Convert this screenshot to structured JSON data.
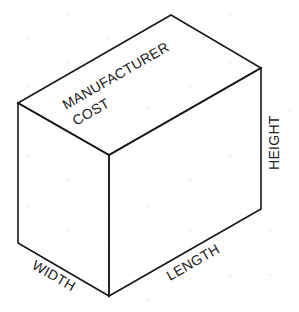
{
  "diagram": {
    "type": "isometric-box",
    "faces": {
      "top": {
        "label_line1": "MANUFACTURER",
        "label_line2": "COST"
      }
    },
    "dimensions": {
      "height": "HEIGHT",
      "width": "WIDTH",
      "length": "LENGTH"
    },
    "colors": {
      "line": "#1a1a1a",
      "text": "#222222",
      "background": "#ffffff"
    }
  }
}
